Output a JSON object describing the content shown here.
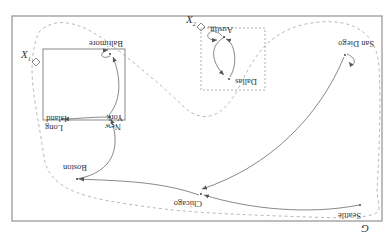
{
  "diagram": {
    "title": "G",
    "orientation_deg": 180,
    "colors": {
      "frame": "#9a9a9a",
      "edge": "#555555",
      "text": "#333333",
      "region": "#b0b0b0"
    },
    "nodes": [
      {
        "id": "seattle",
        "label": "Seattle"
      },
      {
        "id": "chicago",
        "label": "Chicago"
      },
      {
        "id": "boston",
        "label": "Boston"
      },
      {
        "id": "new_york",
        "label": "New York"
      },
      {
        "id": "long_island",
        "label": "Long Island"
      },
      {
        "id": "baltimore",
        "label": "Baltimore"
      },
      {
        "id": "dallas",
        "label": "Dallas"
      },
      {
        "id": "austin",
        "label": "Austin"
      },
      {
        "id": "san_diego",
        "label": "San Diego"
      }
    ],
    "labels": {
      "seattle": "Seattle",
      "chicago": "Chicago",
      "boston": "Boston",
      "new": "New",
      "york": "York",
      "long": "Long",
      "island": "Island",
      "baltimore": "Baltimore",
      "dallas": "Dallas",
      "austin": "Austin",
      "san_diego": "San Diego",
      "marker_a": "X",
      "marker_a_sub": "1",
      "marker_b": "X",
      "marker_b_sub": "2"
    },
    "clusters": [
      {
        "id": "east",
        "style": "solid",
        "members": [
          "boston",
          "new_york",
          "long_island"
        ]
      },
      {
        "id": "texas",
        "style": "dashed",
        "members": [
          "dallas",
          "austin"
        ]
      }
    ],
    "edges": [
      {
        "from": "seattle",
        "to": "chicago"
      },
      {
        "from": "chicago",
        "to": "boston"
      },
      {
        "from": "boston",
        "to": "new_york"
      },
      {
        "from": "new_york",
        "to": "long_island"
      },
      {
        "from": "new_york",
        "to": "baltimore"
      },
      {
        "from": "baltimore",
        "to": "baltimore"
      },
      {
        "from": "dallas",
        "to": "austin"
      },
      {
        "from": "austin",
        "to": "dallas"
      },
      {
        "from": "austin",
        "to": "austin"
      },
      {
        "from": "san_diego",
        "to": "chicago"
      },
      {
        "from": "san_diego",
        "to": "san_diego"
      }
    ]
  }
}
